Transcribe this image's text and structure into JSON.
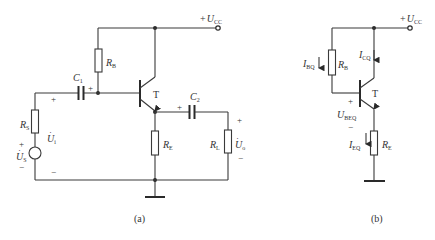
{
  "circuit_a": {
    "caption": "(a)",
    "supply": {
      "sign": "+",
      "symbol": "U",
      "sub": "CC"
    },
    "resistors": {
      "RB": {
        "symbol": "R",
        "sub": "B"
      },
      "RS": {
        "symbol": "R",
        "sub": "S"
      },
      "RE": {
        "symbol": "R",
        "sub": "E"
      },
      "RL": {
        "symbol": "R",
        "sub": "L"
      }
    },
    "capacitors": {
      "C1": {
        "symbol": "C",
        "sub": "1"
      },
      "C2": {
        "symbol": "C",
        "sub": "2"
      }
    },
    "transistor": "T",
    "source": {
      "symbol": "U",
      "sub": "S",
      "dot": "·"
    },
    "input_voltage": {
      "symbol": "U",
      "sub": "i",
      "dot": "·"
    },
    "output_voltage": {
      "symbol": "U",
      "sub": "o",
      "dot": "·"
    },
    "polarity": {
      "plus": "+",
      "minus": "−"
    }
  },
  "circuit_b": {
    "caption": "(b)",
    "supply": {
      "sign": "+",
      "symbol": "U",
      "sub": "CC"
    },
    "RB": {
      "symbol": "R",
      "sub": "B"
    },
    "RE": {
      "symbol": "R",
      "sub": "E"
    },
    "transistor": "T",
    "IBQ": {
      "symbol": "I",
      "sub": "BQ"
    },
    "ICQ": {
      "symbol": "I",
      "sub": "CQ"
    },
    "IEQ": {
      "symbol": "I",
      "sub": "EQ"
    },
    "UBEQ": {
      "symbol": "U",
      "sub": "BEQ"
    },
    "polarity": {
      "plus": "+",
      "minus": "−"
    }
  }
}
